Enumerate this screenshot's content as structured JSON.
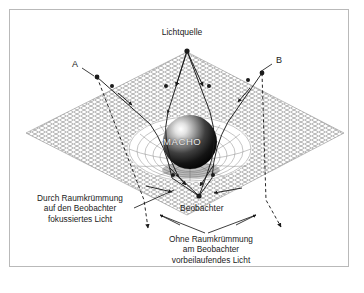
{
  "figure": {
    "title_alt": "Gravitational microlensing by a MACHO",
    "frame_color": "#b9b9b9",
    "background": "#ffffff",
    "ink_color": "#1b1b1b",
    "mesh_color": "#6e6e6e",
    "sphere_label_color": "#e9e9e9"
  },
  "labels": {
    "light_source": "Lichtquelle",
    "point_a": "A",
    "point_b": "B",
    "macho": "MACHO",
    "observer": "Beobachter",
    "focused_light": {
      "line1": "Durch Raumkrümmung",
      "line2": "auf den Beobachter",
      "line3": "fokussiertes Licht"
    },
    "passing_light": {
      "line1": "Ohne Raumkrümmung",
      "line2": "am Beobachter",
      "line3": "vorbeilaufendes Licht"
    }
  },
  "geometry": {
    "plane_vertices": {
      "left": [
        26,
        133
      ],
      "top": [
        187,
        52
      ],
      "right": [
        344,
        133
      ],
      "bottom": [
        187,
        215
      ]
    },
    "light_source_point": [
      187,
      51
    ],
    "observer_point": [
      199,
      196
    ],
    "macho_center": [
      190,
      142
    ],
    "macho_radius": 27,
    "node_a": [
      97,
      77
    ],
    "node_b": [
      262,
      73
    ]
  },
  "ray_legend": {
    "solid_meaning": "focused light bent by spacetime curvature reaching the observer",
    "dashed_meaning": "light that passes by the observer without curvature"
  }
}
